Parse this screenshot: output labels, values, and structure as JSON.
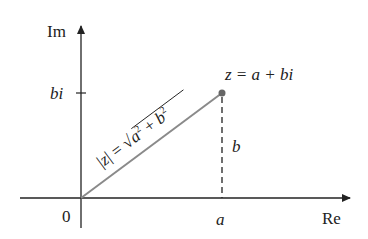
{
  "diagram": {
    "axes": {
      "imaginary_label": "Im",
      "real_label": "Re",
      "origin_label": "0"
    },
    "ticks": {
      "imaginary_tick": "bi",
      "real_tick": "a"
    },
    "point_label": "z = a + bi",
    "vertical_segment_label": "b",
    "modulus_label": "|z| = √(a² + b²)",
    "colors": {
      "axes": "#222222",
      "vector": "#8a8a8a",
      "point": "#666666"
    }
  }
}
